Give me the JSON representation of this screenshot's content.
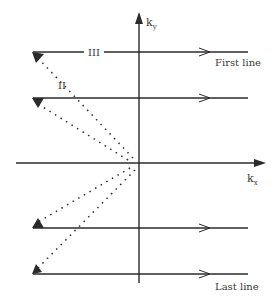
{
  "diagram": {
    "type": "k-space trajectory",
    "axes": {
      "x_label": "k",
      "x_subscript": "x",
      "y_label": "k",
      "y_subscript": "y"
    },
    "labels": {
      "segment_III": "III",
      "segment_II": "II",
      "first_line": "First line",
      "last_line": "Last line"
    },
    "lines": [
      {
        "name": "first-line",
        "y": 52
      },
      {
        "name": "second-line",
        "y": 98
      },
      {
        "name": "third-line",
        "y": 228
      },
      {
        "name": "last-line",
        "y": 274
      }
    ],
    "colors": {
      "stroke": "#2b2b2b",
      "text": "#3a3a3a",
      "background": "#ffffff"
    }
  }
}
